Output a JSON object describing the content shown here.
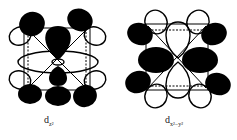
{
  "figure": {
    "panels": [
      {
        "id": "dz2",
        "label_main": "d",
        "label_sub": "z²",
        "description": "d_z2 orbital overlap in an octahedral/cubic ligand field: black lobes along z-axis with torus, ligand p-orbital lobes at cube corners"
      },
      {
        "id": "dx2-y2",
        "label_main": "d",
        "label_sub": "x²−y²",
        "description": "d_x2-y2 orbital: black lobes along x and y axes, ligand lobes at cube corners"
      }
    ],
    "colors": {
      "filled_lobe": "#000000",
      "outline": "#000000",
      "background": "#ffffff"
    }
  }
}
